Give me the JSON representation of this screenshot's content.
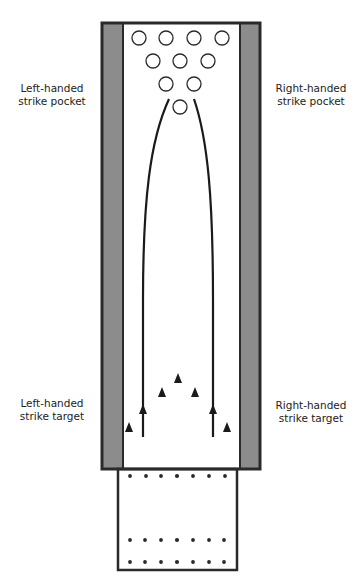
{
  "labels": {
    "left_pocket": "Left-handed\nstrike pocket",
    "right_pocket": "Right-handed\nstrike pocket",
    "left_target": "Left-handed\nstrike target",
    "right_target": "Right-handed\nstrike target"
  },
  "colors": {
    "outline": "#2a2a2a",
    "gutter": "#8c8c8c",
    "lane": "#ffffff"
  },
  "pins": {
    "count": 10,
    "rows": [
      4,
      3,
      2,
      1
    ]
  },
  "target_arrows": {
    "count": 5
  },
  "approach_dots": {
    "rows": 3,
    "per_row": 7
  }
}
